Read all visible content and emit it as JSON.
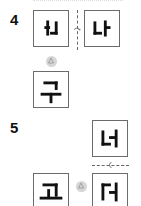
{
  "problems": [
    {
      "number": "4",
      "figures": [
        {
          "id": "q4-original",
          "glyph": "ㅓ+ㄴ (mirrored 나)",
          "role": "original"
        },
        {
          "id": "q4-flipped",
          "glyph": "나",
          "role": "reflected across vertical axis"
        },
        {
          "id": "q4-rotated",
          "glyph": "구",
          "role": "rotated quarter turn"
        }
      ],
      "operations": [
        {
          "type": "flip-vertical-axis",
          "icon": "flip-arrow-icon"
        },
        {
          "type": "rotate-quarter",
          "icon": "quarter-rotation-icon"
        }
      ]
    },
    {
      "number": "5",
      "figures": [
        {
          "id": "q5-top",
          "glyph": "너",
          "role": "original"
        },
        {
          "id": "q5-flipped",
          "glyph": "더 (upside-down 너)",
          "role": "reflected across horizontal axis"
        },
        {
          "id": "q5-rotated",
          "glyph": "고",
          "role": "rotated quarter turn"
        }
      ],
      "operations": [
        {
          "type": "flip-horizontal-axis",
          "icon": "flip-arrow-icon"
        },
        {
          "type": "rotate-quarter",
          "icon": "quarter-rotation-icon"
        }
      ]
    }
  ],
  "colors": {
    "stroke": "#111111",
    "border": "#6b6b6b",
    "dash": "#666666",
    "rotate_disc": "#cfcfcf"
  }
}
